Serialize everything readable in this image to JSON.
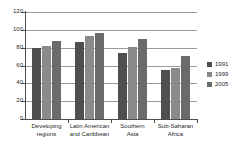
{
  "chart_data": {
    "type": "bar",
    "title": "",
    "subtitle": "",
    "xlabel": "",
    "ylabel": "",
    "ylim": [
      0,
      120
    ],
    "yticks": [
      0,
      20,
      40,
      60,
      80,
      100,
      120
    ],
    "ytick_labels": [
      "0",
      "20",
      "40",
      "60",
      "80",
      "100",
      "120"
    ],
    "grid": true,
    "legend_position": "right",
    "categories": [
      "Developing\nregions",
      "Latin American\nand Caribbean",
      "Southern\nAsia",
      "Sub-Saharan\nAfrica"
    ],
    "series": [
      {
        "name": "1991",
        "color": "#4f4f4f",
        "values": [
          80,
          86,
          74,
          55
        ]
      },
      {
        "name": "1999",
        "color": "#8a8a8a",
        "values": [
          82,
          93,
          81,
          57
        ]
      },
      {
        "name": "2005",
        "color": "#6b6b6b",
        "values": [
          87,
          97,
          90,
          71
        ]
      }
    ]
  },
  "legend": {
    "items": [
      {
        "label": "1991",
        "color": "#4f4f4f"
      },
      {
        "label": "1999",
        "color": "#8a8a8a"
      },
      {
        "label": "2005",
        "color": "#6b6b6b"
      }
    ]
  },
  "axes": {
    "y_axis_color": "#4d4d4d",
    "x_axis_color": "#4d4d4d",
    "gridline_color": "#9a9a9a"
  }
}
